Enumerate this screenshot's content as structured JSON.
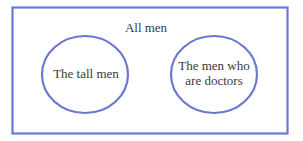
{
  "diagram": {
    "type": "venn-disjoint",
    "stroke_color": "#6a78d0",
    "text_color": "#3a3a3a",
    "universe": {
      "label": "All men"
    },
    "sets": [
      {
        "label": "The tall men"
      },
      {
        "label_line1": "The men who",
        "label_line2": "are doctors"
      }
    ]
  }
}
